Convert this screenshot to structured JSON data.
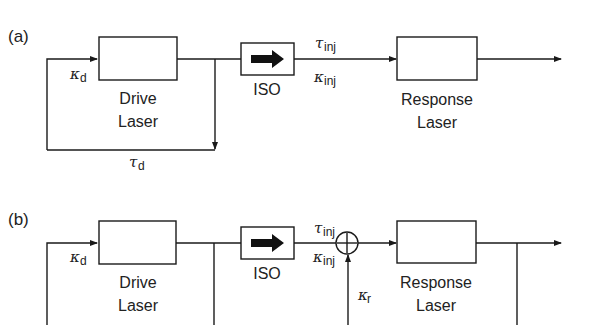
{
  "panels": [
    {
      "id": "a",
      "label": "(a)",
      "drive": {
        "line1": "Drive",
        "line2": "Laser"
      },
      "isolator": "ISO",
      "response": {
        "line1": "Response",
        "line2": "Laser"
      },
      "kappa_d": {
        "sym": "κ",
        "sub": "d"
      },
      "tau_d": {
        "sym": "τ",
        "sub": "d"
      },
      "tau_inj": {
        "sym": "τ",
        "sub": "inj"
      },
      "kappa_inj": {
        "sym": "κ",
        "sub": "inj"
      }
    },
    {
      "id": "b",
      "label": "(b)",
      "drive": {
        "line1": "Drive",
        "line2": "Laser"
      },
      "isolator": "ISO",
      "response": {
        "line1": "Response",
        "line2": "Laser"
      },
      "kappa_d": {
        "sym": "κ",
        "sub": "d"
      },
      "tau_inj": {
        "sym": "τ",
        "sub": "inj"
      },
      "kappa_inj": {
        "sym": "κ",
        "sub": "inj"
      },
      "kappa_r": {
        "sym": "κ",
        "sub": "r"
      },
      "summing_junction": "+"
    }
  ],
  "colors": {
    "line": "#1a1a1a",
    "background": "#ffffff"
  }
}
